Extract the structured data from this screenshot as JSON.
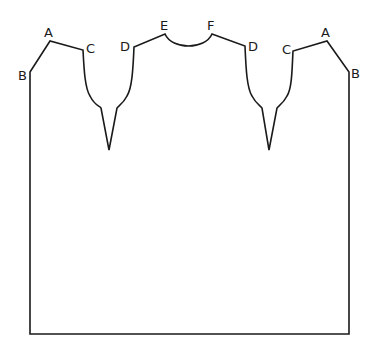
{
  "diagram": {
    "type": "sewing-pattern",
    "stroke_color": "#1a1a1a",
    "background": "#ffffff",
    "labels": [
      {
        "id": "B-left",
        "text": "B",
        "x": 18,
        "y": 80
      },
      {
        "id": "A-left",
        "text": "A",
        "x": 44,
        "y": 37
      },
      {
        "id": "C-left",
        "text": "C",
        "x": 86,
        "y": 53
      },
      {
        "id": "D-left",
        "text": "D",
        "x": 120,
        "y": 51
      },
      {
        "id": "E",
        "text": "E",
        "x": 160,
        "y": 30
      },
      {
        "id": "F",
        "text": "F",
        "x": 207,
        "y": 30
      },
      {
        "id": "D-right",
        "text": "D",
        "x": 248,
        "y": 51
      },
      {
        "id": "C-right",
        "text": "C",
        "x": 282,
        "y": 54
      },
      {
        "id": "A-right",
        "text": "A",
        "x": 321,
        "y": 37
      },
      {
        "id": "B-right",
        "text": "B",
        "x": 351,
        "y": 78
      }
    ]
  }
}
